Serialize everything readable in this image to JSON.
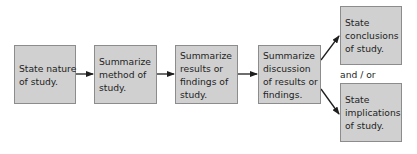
{
  "diagram": {
    "type": "flowchart",
    "colors": {
      "box_fill": "#d0d0d0",
      "box_border": "#8c8c8c",
      "text": "#1e1e1e",
      "arrow": "#1e1e1e"
    },
    "nodes": [
      {
        "id": "state-nature",
        "lines": [
          "State nature",
          "of study."
        ]
      },
      {
        "id": "summarize-method",
        "lines": [
          "Summarize",
          "method of",
          "study."
        ]
      },
      {
        "id": "summarize-results",
        "lines": [
          "Summarize",
          "results or",
          "findings of",
          "study."
        ]
      },
      {
        "id": "summarize-discussion",
        "lines": [
          "Summarize",
          "discussion",
          "of results or",
          "findings."
        ]
      },
      {
        "id": "state-conclusions",
        "lines": [
          "State",
          "conclusions",
          "of study."
        ]
      },
      {
        "id": "state-implications",
        "lines": [
          "State",
          "implications",
          "of study."
        ]
      }
    ],
    "connector_label": "and / or",
    "edges": [
      {
        "from": "state-nature",
        "to": "summarize-method"
      },
      {
        "from": "summarize-method",
        "to": "summarize-results"
      },
      {
        "from": "summarize-results",
        "to": "summarize-discussion"
      },
      {
        "from": "summarize-discussion",
        "to": "state-conclusions"
      },
      {
        "from": "summarize-discussion",
        "to": "state-implications"
      }
    ]
  }
}
